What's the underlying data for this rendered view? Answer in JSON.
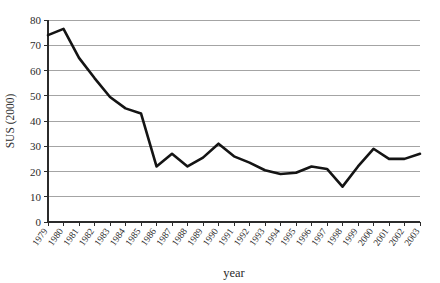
{
  "chart_data": {
    "type": "line",
    "title": "",
    "xlabel": "year",
    "ylabel": "SUS (2000)",
    "xlim": [
      1979,
      2003
    ],
    "ylim": [
      0,
      80
    ],
    "ytick_step": 10,
    "grid": true,
    "grid_axis": "y",
    "legend": false,
    "legend_position": "none",
    "line_color": "#141414",
    "grid_color": "#9a9a9a",
    "axis_color": "#2b2b2b",
    "background_color": "#ffffff",
    "x": [
      1979,
      1980,
      1981,
      1982,
      1983,
      1984,
      1985,
      1986,
      1987,
      1988,
      1989,
      1990,
      1991,
      1992,
      1993,
      1994,
      1995,
      1996,
      1997,
      1998,
      1999,
      2000,
      2001,
      2002,
      2003
    ],
    "categories": [
      "1979",
      "1980",
      "1981",
      "1982",
      "1983",
      "1984",
      "1985",
      "1986",
      "1987",
      "1988",
      "1989",
      "1990",
      "1991",
      "1992",
      "1993",
      "1994",
      "1995",
      "1996",
      "1997",
      "1998",
      "1999",
      "2000",
      "2001",
      "2002",
      "2003"
    ],
    "values": [
      74,
      76.5,
      65,
      57,
      49.5,
      45,
      43,
      22,
      27,
      22,
      25.5,
      31,
      26,
      23.5,
      20.5,
      19,
      19.5,
      22,
      21,
      14,
      22,
      29,
      25,
      25,
      27
    ],
    "ytick_labels": [
      "0",
      "10",
      "20",
      "30",
      "40",
      "50",
      "60",
      "70",
      "80"
    ],
    "ytick_values": [
      0,
      10,
      20,
      30,
      40,
      50,
      60,
      70,
      80
    ]
  }
}
